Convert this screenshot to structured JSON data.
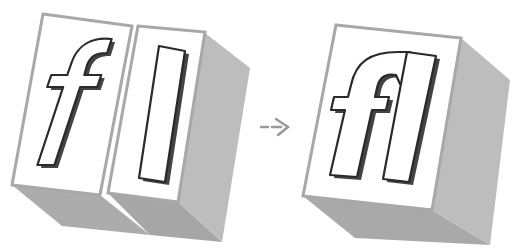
{
  "diagram": {
    "left": {
      "blocks": [
        {
          "glyph": "f"
        },
        {
          "glyph": "l"
        }
      ]
    },
    "arrow": {
      "icon": "dashed-arrow-right-icon"
    },
    "right": {
      "blocks": [
        {
          "glyph": "fl"
        }
      ]
    }
  },
  "colors": {
    "face": "#ffffff",
    "face_border": "#a8a8a8",
    "side": "#bdbdbd",
    "bottom": "#a9a9a9",
    "glyph_stroke": "#2a2a2a",
    "glyph_shadow": "#555555",
    "arrow": "#9a9a9a"
  }
}
